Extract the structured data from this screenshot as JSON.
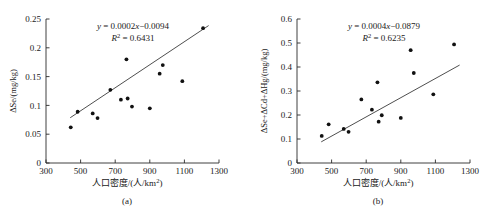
{
  "figure": {
    "panels": [
      {
        "caption": "(a)",
        "equation": "y = 0.0002x−0.0094",
        "equation_y": "y",
        "equation_body": " = 0.0002",
        "equation_x": "x",
        "equation_tail": "−0.0094",
        "r_squared_label": "R",
        "r_squared_exp": "2",
        "r_squared_value": " = 0.6431",
        "xlabel_main": "人口密度/(人/km",
        "xlabel_sup": "2",
        "xlabel_end": ")",
        "ylabel": "ΔSe/(mg/kg)"
      },
      {
        "caption": "(b)",
        "equation": "y = 0.0004x−0.0879",
        "equation_y": "y",
        "equation_body": " = 0.0004",
        "equation_x": "x",
        "equation_tail": "−0.0879",
        "r_squared_label": "R",
        "r_squared_exp": "2",
        "r_squared_value": " = 0.6235",
        "xlabel_main": "人口密度/(人/km",
        "xlabel_sup": "2",
        "xlabel_end": ")",
        "ylabel": "ΔSe+ΔCd+ΔHg/(mg/kg)"
      }
    ]
  },
  "chart_data": [
    {
      "type": "scatter",
      "title": "",
      "subfigure": "(a)",
      "xlabel": "人口密度/(人/km2)",
      "ylabel": "ΔSe/(mg/kg)",
      "xlim": [
        300,
        1300
      ],
      "ylim": [
        0,
        0.25
      ],
      "xticks": [
        300,
        500,
        700,
        900,
        1100,
        1300
      ],
      "yticks": [
        0,
        0.05,
        0.1,
        0.15,
        0.2,
        0.25
      ],
      "grid": false,
      "legend": false,
      "annotations": [
        "y = 0.0002x−0.0094",
        "R² = 0.6431"
      ],
      "trendline": {
        "type": "linear",
        "slope": 0.0002,
        "intercept": -0.0094,
        "r_squared": 0.6431,
        "x_start": 440,
        "x_end": 1240
      },
      "points": [
        {
          "x": 443,
          "y": 0.062
        },
        {
          "x": 483,
          "y": 0.089
        },
        {
          "x": 570,
          "y": 0.086
        },
        {
          "x": 598,
          "y": 0.078
        },
        {
          "x": 672,
          "y": 0.127
        },
        {
          "x": 733,
          "y": 0.11
        },
        {
          "x": 765,
          "y": 0.18
        },
        {
          "x": 772,
          "y": 0.112
        },
        {
          "x": 797,
          "y": 0.098
        },
        {
          "x": 900,
          "y": 0.095
        },
        {
          "x": 957,
          "y": 0.155
        },
        {
          "x": 975,
          "y": 0.17
        },
        {
          "x": 1088,
          "y": 0.142
        },
        {
          "x": 1208,
          "y": 0.234
        }
      ]
    },
    {
      "type": "scatter",
      "title": "",
      "subfigure": "(b)",
      "xlabel": "人口密度/(人/km2)",
      "ylabel": "ΔSe+ΔCd+ΔHg/(mg/kg)",
      "xlim": [
        300,
        1300
      ],
      "ylim": [
        0,
        0.6
      ],
      "xticks": [
        300,
        500,
        700,
        900,
        1100,
        1300
      ],
      "yticks": [
        0,
        0.1,
        0.2,
        0.3,
        0.4,
        0.5,
        0.6
      ],
      "grid": false,
      "legend": false,
      "annotations": [
        "y = 0.0004x−0.0879",
        "R² = 0.6235"
      ],
      "trendline": {
        "type": "linear",
        "slope": 0.0004,
        "intercept": -0.0879,
        "r_squared": 0.6235,
        "x_start": 440,
        "x_end": 1240
      },
      "points": [
        {
          "x": 443,
          "y": 0.113
        },
        {
          "x": 483,
          "y": 0.161
        },
        {
          "x": 570,
          "y": 0.142
        },
        {
          "x": 598,
          "y": 0.13
        },
        {
          "x": 672,
          "y": 0.265
        },
        {
          "x": 733,
          "y": 0.222
        },
        {
          "x": 765,
          "y": 0.336
        },
        {
          "x": 772,
          "y": 0.172
        },
        {
          "x": 790,
          "y": 0.199
        },
        {
          "x": 900,
          "y": 0.188
        },
        {
          "x": 957,
          "y": 0.47
        },
        {
          "x": 975,
          "y": 0.375
        },
        {
          "x": 1088,
          "y": 0.286
        },
        {
          "x": 1208,
          "y": 0.494
        }
      ]
    }
  ]
}
